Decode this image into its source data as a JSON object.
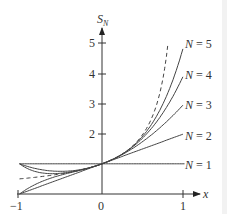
{
  "chart_data": {
    "type": "line",
    "title": "",
    "xlabel": "x",
    "ylabel": "S_N",
    "xlim": [
      -1,
      1
    ],
    "ylim": [
      0,
      5
    ],
    "x_ticks": [
      "-1",
      "0",
      "1"
    ],
    "y_ticks": [
      "2",
      "3",
      "4",
      "5"
    ],
    "grid": false,
    "series": [
      {
        "name": "N = 1",
        "formula": "1",
        "style": "solid"
      },
      {
        "name": "N = 2",
        "formula": "1 + x",
        "style": "solid"
      },
      {
        "name": "N = 3",
        "formula": "1 + x + x^2",
        "style": "solid"
      },
      {
        "name": "N = 4",
        "formula": "1 + x + x^2 + x^3",
        "style": "solid"
      },
      {
        "name": "N = 5",
        "formula": "1 + x + x^2 + x^3 + x^4",
        "style": "solid"
      },
      {
        "name": "1/(1-x)",
        "formula": "1/(1-x)",
        "style": "dashed"
      }
    ]
  },
  "labels": {
    "xaxis": "x",
    "yaxis_main": "S",
    "yaxis_sub": "N",
    "xt_m1": "−1",
    "xt_0": "0",
    "xt_1": "1",
    "yt_2": "2",
    "yt_3": "3",
    "yt_4": "4",
    "yt_5": "5",
    "n1": "N = 1",
    "n2": "N = 2",
    "n3": "N = 3",
    "n4": "N = 4",
    "n5": "N = 5"
  }
}
